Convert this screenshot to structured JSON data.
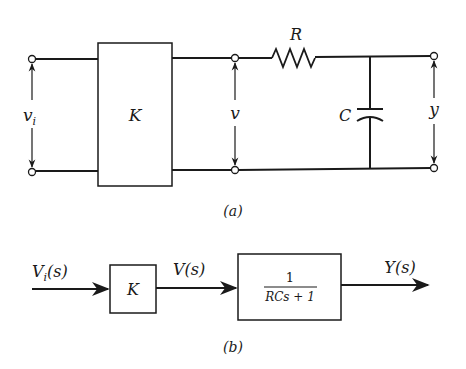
{
  "figure": {
    "part_a": {
      "caption": "(a)",
      "input_voltage_label": "v",
      "input_voltage_sub": "i",
      "amplifier_label": "K",
      "intermediate_voltage_label": "v",
      "resistor_label": "R",
      "capacitor_label": "C",
      "output_voltage_label": "y"
    },
    "part_b": {
      "caption": "(b)",
      "input_signal_label": "V",
      "input_signal_sub": "i",
      "input_signal_arg": "(s)",
      "gain_block_label": "K",
      "intermediate_signal_label": "V(s)",
      "transfer_numerator": "1",
      "transfer_denominator": "RCs + 1",
      "output_signal_label": "Y(s)"
    }
  }
}
